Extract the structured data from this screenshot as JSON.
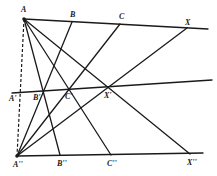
{
  "diagram": {
    "type": "projective-geometry",
    "points": {
      "A": {
        "label": "A",
        "x": 24,
        "y": 19
      },
      "B": {
        "label": "B",
        "x": 72,
        "y": 22
      },
      "C": {
        "label": "C",
        "x": 120,
        "y": 24
      },
      "X": {
        "label": "X",
        "x": 187,
        "y": 28
      },
      "A1": {
        "label": "A'",
        "x": 20,
        "y": 93
      },
      "B1": {
        "label": "B'",
        "x": 43,
        "y": 91
      },
      "C1": {
        "label": "C'",
        "x": 69,
        "y": 90
      },
      "X1": {
        "label": "X'",
        "x": 108,
        "y": 87
      },
      "A2": {
        "label": "A''",
        "x": 17,
        "y": 156
      },
      "B2": {
        "label": "B''",
        "x": 60,
        "y": 155
      },
      "C2": {
        "label": "C''",
        "x": 111,
        "y": 155
      },
      "X2": {
        "label": "X''",
        "x": 190,
        "y": 154
      }
    },
    "labels": {
      "A": "A",
      "B": "B",
      "C": "C",
      "X": "X",
      "A1": "A'",
      "B1": "B'",
      "C1": "C'",
      "X1": "X'",
      "A2": "A''",
      "B2": "B''",
      "C2": "C''",
      "X2": "X''"
    }
  }
}
